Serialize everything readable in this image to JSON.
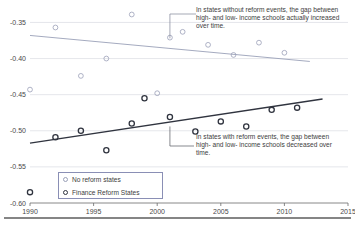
{
  "chart_data": {
    "type": "scatter",
    "title": "",
    "xlabel": "",
    "ylabel": "",
    "xlim": [
      1990,
      2015
    ],
    "ylim": [
      -0.6,
      -0.33
    ],
    "xticks": [
      1990,
      1995,
      2000,
      2005,
      2010,
      2015
    ],
    "yticks": [
      -0.35,
      -0.4,
      -0.45,
      -0.5,
      -0.55,
      -0.6
    ],
    "xtick_labels": [
      "1990",
      "1995",
      "2000",
      "2005",
      "2010",
      "2015"
    ],
    "ytick_labels": [
      "-0.35",
      "-0.40",
      "-0.45",
      "-0.50",
      "-0.55",
      "-0.60"
    ],
    "grid": true,
    "legend_position": "bottom-left",
    "series": [
      {
        "name": "No reform states",
        "marker": "open-circle-light",
        "color": "#9aa0b8",
        "points": [
          {
            "x": 1990,
            "y": -0.443
          },
          {
            "x": 1992,
            "y": -0.357
          },
          {
            "x": 1994,
            "y": -0.424
          },
          {
            "x": 1996,
            "y": -0.4
          },
          {
            "x": 1998,
            "y": -0.339
          },
          {
            "x": 2000,
            "y": -0.448
          },
          {
            "x": 2001,
            "y": -0.371
          },
          {
            "x": 2002,
            "y": -0.363
          },
          {
            "x": 2004,
            "y": -0.381
          },
          {
            "x": 2006,
            "y": -0.395
          },
          {
            "x": 2008,
            "y": -0.378
          },
          {
            "x": 2010,
            "y": -0.392
          }
        ],
        "trend": {
          "x0": 1990,
          "y0": -0.368,
          "x1": 2012,
          "y1": -0.404
        }
      },
      {
        "name": "Finance Reform States",
        "marker": "open-circle-dark",
        "color": "#30343f",
        "points": [
          {
            "x": 1990,
            "y": -0.585
          },
          {
            "x": 1992,
            "y": -0.509
          },
          {
            "x": 1994,
            "y": -0.5
          },
          {
            "x": 1996,
            "y": -0.527
          },
          {
            "x": 1998,
            "y": -0.49
          },
          {
            "x": 1999,
            "y": -0.455
          },
          {
            "x": 2001,
            "y": -0.481
          },
          {
            "x": 2003,
            "y": -0.501
          },
          {
            "x": 2005,
            "y": -0.487
          },
          {
            "x": 2007,
            "y": -0.494
          },
          {
            "x": 2009,
            "y": -0.471
          },
          {
            "x": 2011,
            "y": -0.468
          }
        ],
        "trend": {
          "x0": 1990,
          "y0": -0.517,
          "x1": 2013,
          "y1": -0.456
        }
      }
    ],
    "annotations": [
      {
        "id": "upper",
        "text": "In states without reform events, the gap between high- and low- income schools actually increased over time.",
        "target_x": 2001,
        "target_y": -0.372
      },
      {
        "id": "lower",
        "text": "In states with reform events, the gap between high- and low- income schools decreased over time.",
        "target_x": 2001,
        "target_y": -0.494
      }
    ]
  },
  "legend": {
    "items": [
      {
        "label": "No reform states",
        "marker": "open-circle-light"
      },
      {
        "label": "Finance Reform States",
        "marker": "open-circle-dark"
      }
    ]
  }
}
